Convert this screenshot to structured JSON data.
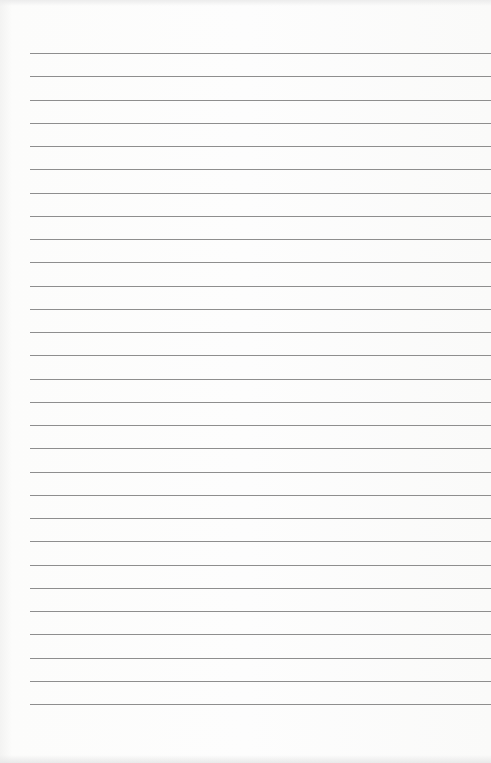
{
  "page": {
    "type": "lined-paper",
    "background_color": "#fbfbfa",
    "line_color": "#8e8e8e",
    "line_count": 29,
    "first_line_y": 53,
    "line_spacing": 23.25,
    "line_left": 30
  }
}
